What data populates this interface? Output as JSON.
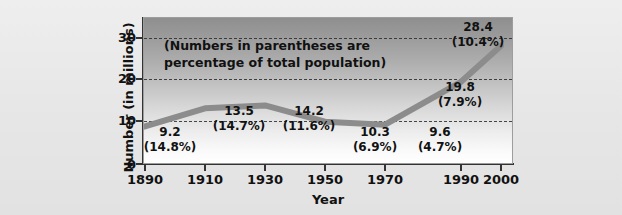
{
  "chart_data": {
    "type": "line",
    "title": "",
    "xlabel": "Year",
    "ylabel": "Number (in millions)",
    "annotation": "(Numbers in parentheses are percentage of total population)",
    "annotation_line1": "(Numbers in parentheses are percentage",
    "annotation_line2": "of total population)",
    "x": [
      1890,
      1910,
      1930,
      1950,
      1970,
      1990,
      2000
    ],
    "xtick_labels": [
      "1890",
      "1910",
      "1930",
      "1950",
      "1970",
      "1990",
      "2000"
    ],
    "values": [
      9.2,
      13.5,
      14.2,
      10.3,
      9.6,
      19.8,
      28.4
    ],
    "value_labels": [
      "9.2",
      "13.5",
      "14.2",
      "10.3",
      "9.6",
      "19.8",
      "28.4"
    ],
    "percent_labels": [
      "(14.8%)",
      "(14.7%)",
      "(11.6%)",
      "(6.9%)",
      "(4.7%)",
      "(7.9%)",
      "(10.4%)"
    ],
    "ylim": [
      0,
      35
    ],
    "xlim": [
      1890,
      2000
    ],
    "ytick_labels": [
      "0",
      "10",
      "20",
      "30"
    ],
    "yticks": [
      0,
      10,
      20,
      30
    ],
    "gridlines": [
      10,
      20,
      30
    ],
    "grid": true,
    "legend": "none",
    "line_color": "#8c8c8c",
    "background_top_color": "#8f8f8f",
    "background_bottom_color": "#ffffff",
    "page_background_color": "#e9e9e9",
    "axis_color": "#333333"
  }
}
